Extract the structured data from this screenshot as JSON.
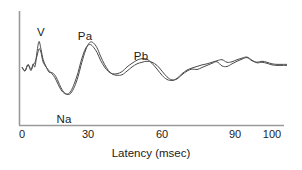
{
  "figure": {
    "background_color": "#ffffff",
    "trace_color": "#4a4a4a",
    "axis_color": "#9a9a9a",
    "text_color": "#1b1b1b"
  },
  "axes": {
    "x_title": "Latency (msec)",
    "y_title": "",
    "x_ticks": [
      {
        "value": 0,
        "label": "0",
        "px": 22
      },
      {
        "value": 30,
        "label": "30",
        "px": 88
      },
      {
        "value": 60,
        "label": "60",
        "px": 162
      },
      {
        "value": 90,
        "label": "90",
        "px": 235
      },
      {
        "value": 100,
        "label": "100",
        "px": 272
      }
    ],
    "x_range": [
      0,
      107
    ],
    "grid": false,
    "legend": "none"
  },
  "annotations": [
    {
      "label": "V",
      "x_px": 41,
      "y_px": 32,
      "latency_msec": 7
    },
    {
      "label": "Pa",
      "x_px": 85,
      "y_px": 36,
      "latency_msec": 28
    },
    {
      "label": "Pb",
      "x_px": 141,
      "y_px": 56,
      "latency_msec": 50
    },
    {
      "label": "Na",
      "x_px": 64,
      "y_px": 119,
      "latency_msec": 19
    }
  ],
  "chart_data": {
    "type": "line",
    "title": "",
    "xlabel": "Latency (msec)",
    "ylabel": "",
    "xlim": [
      0,
      107
    ],
    "ylim": [
      -1.2,
      1.4
    ],
    "grid": false,
    "legend_position": "none",
    "annotations": [
      "V",
      "Na",
      "Pa",
      "Pb"
    ],
    "series": [
      {
        "name": "trace-1",
        "x": [
          0,
          1.2,
          2.4,
          3.6,
          4.4,
          5.2,
          6.0,
          6.8,
          7.6,
          8.4,
          9.6,
          10.8,
          12.0,
          13.2,
          14.4,
          15.6,
          17.0,
          18.4,
          19.6,
          21.0,
          22.4,
          23.6,
          25.0,
          26.2,
          27.4,
          28.6,
          30.0,
          31.4,
          33.0,
          34.6,
          36.2,
          38.0,
          40.0,
          42.0,
          44.0,
          46.0,
          48.0,
          50.0,
          52.0,
          54.0,
          56.0,
          58.0,
          60.0,
          62.0,
          64.0,
          66.0,
          68.0,
          70.0,
          72.0,
          74.0,
          76.0,
          78.0,
          80.0,
          82.0,
          84.0,
          86.0,
          88.0,
          90.0,
          92.0,
          94.0,
          96.0,
          98.0,
          100.0,
          102.0,
          104.0,
          106.0
        ],
        "y": [
          0.02,
          -0.12,
          0.12,
          -0.1,
          0.16,
          0.05,
          0.62,
          1.02,
          0.72,
          0.34,
          0.06,
          -0.16,
          -0.18,
          -0.28,
          -0.5,
          -0.76,
          -0.95,
          -1.02,
          -0.96,
          -0.72,
          -0.34,
          0.1,
          0.56,
          0.86,
          1.0,
          0.96,
          0.78,
          0.46,
          0.14,
          -0.1,
          -0.24,
          -0.28,
          -0.26,
          -0.12,
          0.04,
          0.16,
          0.22,
          0.26,
          0.22,
          0.1,
          -0.12,
          -0.34,
          -0.46,
          -0.42,
          -0.26,
          -0.12,
          -0.04,
          -0.06,
          0.02,
          0.1,
          0.18,
          0.24,
          0.08,
          0.06,
          0.16,
          0.26,
          0.34,
          0.4,
          0.28,
          0.22,
          0.26,
          0.22,
          0.16,
          0.14,
          0.14,
          0.14
        ]
      },
      {
        "name": "trace-2",
        "x": [
          0,
          1.2,
          2.4,
          3.6,
          4.4,
          5.2,
          6.0,
          6.8,
          7.6,
          8.4,
          9.6,
          10.8,
          12.0,
          13.2,
          14.4,
          15.6,
          17.0,
          18.4,
          19.6,
          21.0,
          22.4,
          23.6,
          25.0,
          26.2,
          27.4,
          28.6,
          30.0,
          31.4,
          33.0,
          34.6,
          36.2,
          38.0,
          40.0,
          42.0,
          44.0,
          46.0,
          48.0,
          50.0,
          52.0,
          54.0,
          56.0,
          58.0,
          60.0,
          62.0,
          64.0,
          66.0,
          68.0,
          70.0,
          72.0,
          74.0,
          76.0,
          78.0,
          80.0,
          82.0,
          84.0,
          86.0,
          88.0,
          90.0,
          92.0,
          94.0,
          96.0,
          98.0,
          100.0,
          102.0,
          104.0,
          106.0
        ],
        "y": [
          0.04,
          -0.1,
          0.14,
          -0.06,
          0.1,
          0.22,
          0.46,
          0.74,
          0.6,
          0.24,
          0.04,
          -0.1,
          -0.22,
          -0.38,
          -0.62,
          -0.84,
          -0.98,
          -1.0,
          -0.88,
          -0.58,
          -0.18,
          0.26,
          0.66,
          0.86,
          0.9,
          0.8,
          0.6,
          0.3,
          0.04,
          -0.14,
          -0.22,
          -0.22,
          -0.14,
          0.04,
          0.18,
          0.3,
          0.36,
          0.34,
          0.18,
          -0.04,
          -0.28,
          -0.44,
          -0.48,
          -0.4,
          -0.22,
          -0.08,
          0.0,
          0.06,
          0.12,
          0.16,
          0.22,
          0.28,
          0.32,
          0.22,
          0.24,
          0.32,
          0.38,
          0.42,
          0.3,
          0.2,
          0.22,
          0.18,
          0.12,
          0.1,
          0.1,
          0.1
        ]
      }
    ]
  }
}
